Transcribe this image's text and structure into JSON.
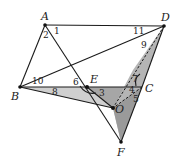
{
  "figure": {
    "points": {
      "A": {
        "label": "A",
        "x": 45,
        "y": 25
      },
      "D": {
        "label": "D",
        "x": 164,
        "y": 26
      },
      "B": {
        "label": "B",
        "x": 20,
        "y": 87
      },
      "C": {
        "label": "C",
        "x": 142,
        "y": 87
      },
      "E": {
        "label": "E",
        "x": 87,
        "y": 87
      },
      "O": {
        "label": "O",
        "x": 113,
        "y": 108
      },
      "F": {
        "label": "F",
        "x": 121,
        "y": 142
      }
    },
    "angle_labels": {
      "a1": "1",
      "a2": "2",
      "a3": "3",
      "a4": "4",
      "a5": "5",
      "a6": "6",
      "a7": "7",
      "a8": "8",
      "a9": "9",
      "a10": "10",
      "a11": "11"
    },
    "colors": {
      "shade_light": "#c8c8c8",
      "shade_mid": "#a9a9a9",
      "shade_dark": "#8f8f8f",
      "line": "#1a1a1a"
    }
  }
}
